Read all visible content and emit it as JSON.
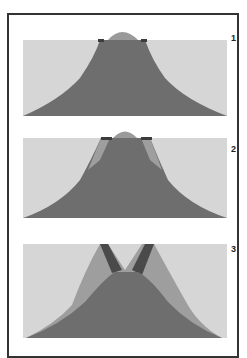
{
  "figure": {
    "type": "volcano-evolution-diagram",
    "panels": [
      {
        "label": "1",
        "stage": "summit dome atop cone"
      },
      {
        "label": "2",
        "stage": "flanks begin to fracture"
      },
      {
        "label": "3",
        "stage": "summit collapse with fractured walls"
      }
    ],
    "colors": {
      "sky": "#d6d6d6",
      "cone": "#6e6e6e",
      "dome": "#9a9a9a",
      "flank": "#9e9e9e",
      "fracture": "#4a4a4a",
      "frame": "#333333"
    }
  }
}
